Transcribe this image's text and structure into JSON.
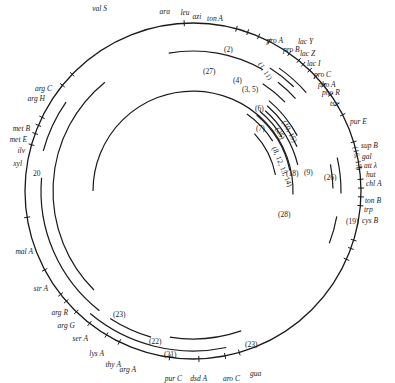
{
  "diagram": {
    "type": "circular-genetic-map",
    "center": [
      193,
      191
    ],
    "radius": 168,
    "genes": [
      {
        "name": "val S",
        "angle": -93,
        "lx": 107,
        "ly": 11,
        "anchor": "end"
      },
      {
        "name": "ara",
        "angle": -75,
        "lx": 170,
        "ly": 14,
        "anchor": "end"
      },
      {
        "name": "leu",
        "angle": -71,
        "lx": 185,
        "ly": 15,
        "anchor": "middle"
      },
      {
        "name": "azi",
        "angle": -67,
        "lx": 197,
        "ly": 19,
        "anchor": "middle"
      },
      {
        "name": "ton A",
        "angle": -63,
        "lx": 215,
        "ly": 21,
        "anchor": "middle"
      },
      {
        "name": "pro A",
        "angle": -55,
        "lx": 283,
        "ly": 43,
        "anchor": "end"
      },
      {
        "name": "pro B",
        "angle": -51,
        "lx": 283,
        "ly": 52,
        "anchor": "start"
      },
      {
        "name": "lac Y",
        "angle": -49,
        "lx": 298,
        "ly": 44,
        "anchor": "start"
      },
      {
        "name": "lac Z",
        "angle": -46,
        "lx": 300,
        "ly": 56,
        "anchor": "start"
      },
      {
        "name": "lac I",
        "angle": -43,
        "lx": 307,
        "ly": 66,
        "anchor": "start"
      },
      {
        "name": "pro C",
        "angle": -39,
        "lx": 314,
        "ly": 77,
        "anchor": "start"
      },
      {
        "name": "pho A",
        "angle": -35,
        "lx": 318,
        "ly": 87,
        "anchor": "start"
      },
      {
        "name": "pho R",
        "angle": -31,
        "lx": 322,
        "ly": 95,
        "anchor": "start"
      },
      {
        "name": "tsx",
        "angle": -27,
        "lx": 330,
        "ly": 106,
        "anchor": "start"
      },
      {
        "name": "pur E",
        "angle": -17,
        "lx": 350,
        "ly": 124,
        "anchor": "start"
      },
      {
        "name": "sup B",
        "angle": -8,
        "lx": 361,
        "ly": 148,
        "anchor": "start"
      },
      {
        "name": "gal",
        "angle": -4,
        "lx": 362,
        "ly": 159,
        "anchor": "start"
      },
      {
        "name": "att λ",
        "angle": -1,
        "lx": 364,
        "ly": 168,
        "anchor": "start"
      },
      {
        "name": "hut",
        "angle": 2,
        "lx": 366,
        "ly": 177,
        "anchor": "start"
      },
      {
        "name": "chl A",
        "angle": 5,
        "lx": 366,
        "ly": 186,
        "anchor": "start"
      },
      {
        "name": "ton B",
        "angle": 17,
        "lx": 365,
        "ly": 203,
        "anchor": "start"
      },
      {
        "name": "trp",
        "angle": 20,
        "lx": 364,
        "ly": 212,
        "anchor": "start"
      },
      {
        "name": "cys B",
        "angle": 24,
        "lx": 362,
        "ly": 223,
        "anchor": "start"
      },
      {
        "name": "gua",
        "angle": 74,
        "lx": 250,
        "ly": 376,
        "anchor": "start"
      },
      {
        "name": "aro C",
        "angle": 79,
        "lx": 240,
        "ly": 381,
        "anchor": "end"
      },
      {
        "name": "dsd A",
        "angle": 88,
        "lx": 207,
        "ly": 381,
        "anchor": "end"
      },
      {
        "name": "pur C",
        "angle": 98,
        "lx": 182,
        "ly": 381,
        "anchor": "end"
      },
      {
        "name": "arg A",
        "angle": 116,
        "lx": 136,
        "ly": 372,
        "anchor": "end"
      },
      {
        "name": "thy A",
        "angle": 121,
        "lx": 121,
        "ly": 367,
        "anchor": "end"
      },
      {
        "name": "lys A",
        "angle": 128,
        "lx": 104,
        "ly": 356,
        "anchor": "end"
      },
      {
        "name": "ser A",
        "angle": 134,
        "lx": 88,
        "ly": 341,
        "anchor": "end"
      },
      {
        "name": "arg G",
        "angle": 139,
        "lx": 75,
        "ly": 328,
        "anchor": "end"
      },
      {
        "name": "arg R",
        "angle": 142,
        "lx": 68,
        "ly": 315,
        "anchor": "end"
      },
      {
        "name": "str A",
        "angle": 152,
        "lx": 48,
        "ly": 291,
        "anchor": "end"
      },
      {
        "name": "mal A",
        "angle": 171,
        "lx": 33,
        "ly": 254,
        "anchor": "end"
      },
      {
        "name": "xyl",
        "angle": 196,
        "lx": 22,
        "ly": 166,
        "anchor": "end"
      },
      {
        "name": "ilv",
        "angle": 200,
        "lx": 25,
        "ly": 153,
        "anchor": "end"
      },
      {
        "name": "met E",
        "angle": 203,
        "lx": 27,
        "ly": 142,
        "anchor": "end"
      },
      {
        "name": "met B",
        "angle": 206,
        "lx": 30,
        "ly": 131,
        "anchor": "end"
      },
      {
        "name": "arg H",
        "angle": 219,
        "lx": 45,
        "ly": 101,
        "anchor": "end"
      },
      {
        "name": "arg C",
        "angle": 224,
        "lx": 52,
        "ly": 91,
        "anchor": "end"
      }
    ],
    "arcs": [
      {
        "id": "arc-1-11",
        "r": 150,
        "a0": -55,
        "a1": -41
      },
      {
        "id": "arc-2",
        "r": 145,
        "a0": -58,
        "a1": -46
      },
      {
        "id": "arc-3-5",
        "r": 138,
        "a0": -52,
        "a1": -42
      },
      {
        "id": "arc-27",
        "r": 140,
        "a0": -100,
        "a1": -60
      },
      {
        "id": "arc-4",
        "r": 128,
        "a0": -57,
        "a1": -44
      },
      {
        "id": "arc-6",
        "r": 118,
        "a0": -50,
        "a1": -28
      },
      {
        "id": "arc-7",
        "r": 113,
        "a0": -49,
        "a1": -23
      },
      {
        "id": "arc-8-12-13-14",
        "r": 108,
        "a0": -48,
        "a1": -14
      },
      {
        "id": "arc-10-15",
        "r": 104,
        "a0": -50,
        "a1": -31
      },
      {
        "id": "arc-9",
        "r": 99,
        "a0": -50,
        "a1": -12
      },
      {
        "id": "arc-25",
        "r": 94,
        "a0": -55,
        "a1": -32
      },
      {
        "id": "arc-18",
        "r": 84,
        "a0": -43,
        "a1": -11
      },
      {
        "id": "arc-28",
        "r": 100,
        "a0": -180,
        "a1": 2
      },
      {
        "id": "arc-16-17",
        "r": 148,
        "a0": -13,
        "a1": 1
      },
      {
        "id": "arc-26",
        "r": 140,
        "a0": -11,
        "a1": -1
      },
      {
        "id": "arc-19",
        "r": 146,
        "a0": 10,
        "a1": 21
      },
      {
        "id": "arc-20-left",
        "r": 155,
        "a0": 215,
        "a1": 195
      },
      {
        "id": "arc-inner-left",
        "r": 140,
        "a0": 231,
        "a1": 135
      },
      {
        "id": "arc-23-left",
        "r": 152,
        "a0": 185,
        "a1": 128
      },
      {
        "id": "arc-22",
        "r": 152,
        "a0": 123,
        "a1": 106
      },
      {
        "id": "arc-21",
        "r": 160,
        "a0": 130,
        "a1": 78
      },
      {
        "id": "arc-23-bottom",
        "r": 148,
        "a0": 99,
        "a1": 71
      }
    ],
    "labels": [
      {
        "text": "(2)",
        "x": 224,
        "y": 52
      },
      {
        "text": "(1, 11)",
        "x": 258,
        "y": 64,
        "rot": 58
      },
      {
        "text": "(27)",
        "x": 203,
        "y": 74
      },
      {
        "text": "(4)",
        "x": 233,
        "y": 83
      },
      {
        "text": "(3, 5)",
        "x": 242,
        "y": 92
      },
      {
        "text": "(6)",
        "x": 255,
        "y": 111
      },
      {
        "text": "(7)",
        "x": 256,
        "y": 131
      },
      {
        "text": "(8, 12, 13, 14)",
        "x": 272,
        "y": 148,
        "rot": 68
      },
      {
        "text": "(10, 15)",
        "x": 282,
        "y": 122,
        "rot": 62
      },
      {
        "text": "(25)",
        "x": 275,
        "y": 129,
        "rot": 62
      },
      {
        "text": "(9)",
        "x": 304,
        "y": 175
      },
      {
        "text": "(18)",
        "x": 286,
        "y": 176
      },
      {
        "text": "(28)",
        "x": 278,
        "y": 217
      },
      {
        "text": "(16, 17)",
        "x": 353,
        "y": 147,
        "rot": 80
      },
      {
        "text": "(26)",
        "x": 324,
        "y": 180
      },
      {
        "text": "(19)",
        "x": 346,
        "y": 224
      },
      {
        "text": "20",
        "x": 33,
        "y": 176
      },
      {
        "text": "(23)",
        "x": 113,
        "y": 317
      },
      {
        "text": "(22)",
        "x": 149,
        "y": 344
      },
      {
        "text": "(21)",
        "x": 164,
        "y": 357
      },
      {
        "text": "(23)",
        "x": 245,
        "y": 347
      }
    ]
  }
}
